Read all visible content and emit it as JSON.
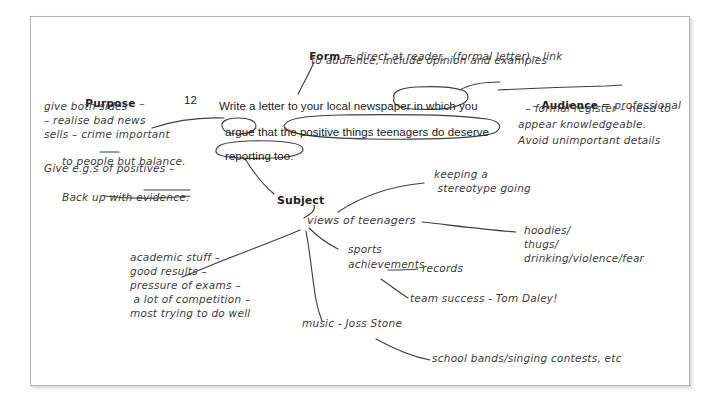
{
  "page": {
    "type": "annotated-exam-question",
    "background_color": "#ffffff",
    "sheet_border_color": "#b4b4b4",
    "ink_color": "#3c3c3c",
    "printed_text_color": "#1a1a1a"
  },
  "question": {
    "number": "12",
    "line1": "Write a letter to your local newspaper in which you",
    "line2": "argue that the positive things teenagers do deserve",
    "line3": "reporting too.",
    "circled_phrases": [
      "local newspaper",
      "argue",
      "positive things teenagers do deserve reporting too."
    ]
  },
  "annotations": {
    "form": {
      "label": "Form",
      "body": " = direct at reader,  (formal letter) – link",
      "line2": "to audience, include opinion and examples"
    },
    "purpose": {
      "label": "Purpose",
      "dash": " –",
      "lines": [
        "give both sides",
        "– realise bad news",
        "sells – crime important",
        " to people ",
        "but",
        " balance.",
        "Give e.g.s of positives –",
        " Back up with ",
        "evidence",
        "."
      ],
      "line1": "give both sides",
      "line2": "– realise bad news",
      "line3": "sells – crime important",
      "line4a": " to people ",
      "line4b": "but",
      "line4c": " balance.",
      "line5": "Give e.g.s of positives –",
      "line6a": " Back up with ",
      "line6b": "evidence",
      "line6c": "."
    },
    "audience": {
      "dashprefix": "– ",
      "label": "Audience",
      "body": " = professional",
      "line2": " – formal register – need to",
      "line3": "appear knowledgeable.",
      "line4": "Avoid unimportant details"
    },
    "subject": {
      "label": "Subject"
    }
  },
  "mindmap": {
    "root": "views of teenagers",
    "branches": [
      {
        "id": "stereotype",
        "line1": "keeping a",
        "line2": " stereotype going"
      },
      {
        "id": "hoodies",
        "line1": "hoodies/",
        "line2": "thugs/",
        "line3": "drinking/violence/fear"
      },
      {
        "id": "sports",
        "line1": "sports",
        "line2": "achievements"
      },
      {
        "id": "records",
        "line1": "records"
      },
      {
        "id": "team-success",
        "line1": "team success - Tom Daley!"
      },
      {
        "id": "music",
        "line1": "music - Joss Stone"
      },
      {
        "id": "school-bands",
        "line1": "school bands/singing contests, etc"
      },
      {
        "id": "academic",
        "line1": "academic stuff –",
        "line2": "good results –",
        "line3": "pressure of exams –",
        "line4": " a lot of competition –",
        "line5": "most trying to do well"
      }
    ]
  }
}
